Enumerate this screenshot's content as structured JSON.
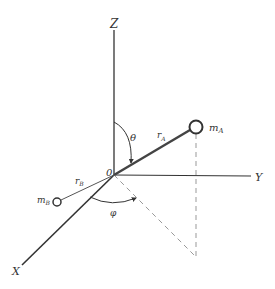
{
  "diagram": {
    "type": "3D coordinate system with two masses on a rigid rotor",
    "axes": {
      "z_label": "Z",
      "y_label": "Y",
      "x_label": "X",
      "origin_label": "0"
    },
    "masses": {
      "a": {
        "label": "m",
        "subscript": "A"
      },
      "b": {
        "label": "m",
        "subscript": "B"
      }
    },
    "vectors": {
      "r_a": {
        "label": "r",
        "subscript": "A"
      },
      "r_b": {
        "label": "r",
        "subscript": "B"
      }
    },
    "angles": {
      "polar": "θ",
      "azimuthal": "φ"
    },
    "colors": {
      "line": "#333333",
      "dashed": "#888888",
      "background": "#ffffff"
    }
  }
}
